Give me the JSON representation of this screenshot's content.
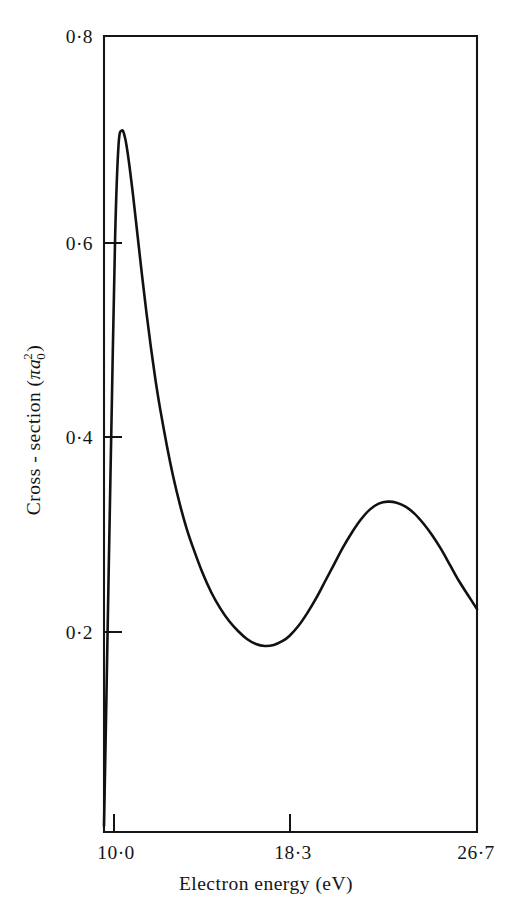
{
  "chart_data": {
    "type": "line",
    "title": "",
    "xlabel": "Electron energy (eV)",
    "ylabel": "Cross - section (πa₀²)",
    "ylabel_parts": {
      "main": "Cross - section  (",
      "pi": "π",
      "a": "a",
      "sub": "0",
      "sup": "2",
      "close": ")"
    },
    "xlim": [
      10.0,
      26.7
    ],
    "ylim": [
      0.0,
      0.8
    ],
    "grid": false,
    "legend": null,
    "x_ticks": [
      {
        "value": 10.0,
        "label": "10·0"
      },
      {
        "value": 18.3,
        "label": "18·3"
      },
      {
        "value": 26.7,
        "label": "26·7"
      }
    ],
    "y_ticks": [
      {
        "value": 0.8,
        "label": "0·8"
      },
      {
        "value": 0.6,
        "label": "0·6"
      },
      {
        "value": 0.4,
        "label": "0·4"
      },
      {
        "value": 0.2,
        "label": "0·2"
      }
    ],
    "series": [
      {
        "name": "cross-section",
        "color": "#111111",
        "x": [
          10.0,
          10.1,
          10.2,
          10.35,
          10.5,
          10.65,
          10.8,
          10.95,
          11.1,
          11.3,
          11.5,
          11.7,
          11.9,
          12.1,
          12.3,
          12.5,
          12.8,
          13.1,
          13.4,
          13.7,
          14.0,
          14.4,
          14.8,
          15.2,
          15.6,
          16.0,
          16.4,
          16.8,
          17.2,
          17.6,
          18.0,
          18.3,
          18.7,
          19.1,
          19.5,
          19.9,
          20.3,
          20.7,
          21.1,
          21.5,
          21.9,
          22.3,
          22.7,
          23.1,
          23.5,
          23.9,
          24.3,
          24.7,
          25.1,
          25.5,
          25.9,
          26.3,
          26.7
        ],
        "y": [
          0.006,
          0.125,
          0.25,
          0.43,
          0.6,
          0.69,
          0.705,
          0.697,
          0.676,
          0.64,
          0.6,
          0.56,
          0.522,
          0.487,
          0.455,
          0.427,
          0.39,
          0.357,
          0.329,
          0.305,
          0.285,
          0.261,
          0.241,
          0.225,
          0.212,
          0.202,
          0.194,
          0.189,
          0.187,
          0.188,
          0.192,
          0.197,
          0.207,
          0.22,
          0.235,
          0.252,
          0.269,
          0.286,
          0.301,
          0.314,
          0.324,
          0.33,
          0.332,
          0.331,
          0.327,
          0.32,
          0.31,
          0.298,
          0.284,
          0.268,
          0.252,
          0.238,
          0.224
        ]
      }
    ],
    "annotations": {
      "first_peak": {
        "x": 10.8,
        "y": 0.705
      },
      "minimum": {
        "x": 17.2,
        "y": 0.187
      },
      "second_peak": {
        "x": 22.7,
        "y": 0.332
      }
    }
  },
  "figure": {
    "plot_box": {
      "left": 104,
      "top": 36,
      "right": 477,
      "bottom": 832
    }
  }
}
